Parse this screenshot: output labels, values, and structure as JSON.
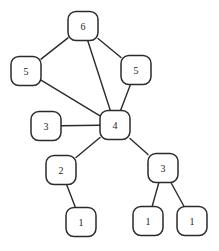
{
  "diagram": {
    "background_color": "#ffffff",
    "node_fill": "#ffffff",
    "node_stroke": "#2b2b2b",
    "edge_stroke": "#2b2b2b",
    "label_color": "#1a1a1a",
    "node_width": 30,
    "node_height": 29,
    "node_corner_radius": 8
  },
  "chart_data": {
    "type": "diagram",
    "title": "",
    "nodes": [
      {
        "id": "n6",
        "label": "6",
        "x": 83,
        "y": 26
      },
      {
        "id": "n5left",
        "label": "5",
        "x": 26,
        "y": 71
      },
      {
        "id": "n5right",
        "label": "5",
        "x": 136,
        "y": 70
      },
      {
        "id": "n4",
        "label": "4",
        "x": 115,
        "y": 125
      },
      {
        "id": "n3left",
        "label": "3",
        "x": 46,
        "y": 126
      },
      {
        "id": "n2",
        "label": "2",
        "x": 61,
        "y": 170
      },
      {
        "id": "n3right",
        "label": "3",
        "x": 163,
        "y": 168
      },
      {
        "id": "n1a",
        "label": "1",
        "x": 81,
        "y": 222
      },
      {
        "id": "n1b",
        "label": "1",
        "x": 148,
        "y": 221
      },
      {
        "id": "n1c",
        "label": "1",
        "x": 192,
        "y": 221
      }
    ],
    "edges": [
      {
        "from": "n6",
        "to": "n5left"
      },
      {
        "from": "n6",
        "to": "n5right"
      },
      {
        "from": "n6",
        "to": "n4"
      },
      {
        "from": "n5left",
        "to": "n4"
      },
      {
        "from": "n5right",
        "to": "n4"
      },
      {
        "from": "n3left",
        "to": "n4"
      },
      {
        "from": "n4",
        "to": "n2"
      },
      {
        "from": "n4",
        "to": "n3right"
      },
      {
        "from": "n2",
        "to": "n1a"
      },
      {
        "from": "n3right",
        "to": "n1b"
      },
      {
        "from": "n3right",
        "to": "n1c"
      }
    ]
  }
}
